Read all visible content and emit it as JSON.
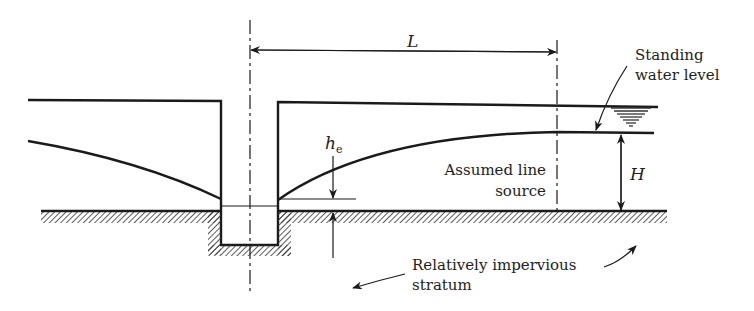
{
  "diagram": {
    "labels": {
      "length": "L",
      "head_symbol": "h",
      "head_subscript": "e",
      "height": "H",
      "standing_water_1": "Standing",
      "standing_water_2": "water level",
      "line_source_1": "Assumed line",
      "line_source_2": "source",
      "stratum_1": "Relatively impervious",
      "stratum_2": "stratum"
    },
    "colors": {
      "line": "#1a1a1a",
      "hatch": "#333333",
      "text": "#222222"
    }
  }
}
